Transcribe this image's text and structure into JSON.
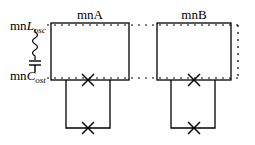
{
  "diagram": {
    "modules": [
      {
        "id": "A",
        "label": "mnA"
      },
      {
        "id": "B",
        "label": "mnB"
      }
    ],
    "components": {
      "inductor": {
        "prefix": "mn",
        "symbol": "L",
        "subscript": "osc"
      },
      "capacitor": {
        "prefix": "mn",
        "symbol": "C",
        "subscript": "ost"
      }
    },
    "junctions": {
      "symbol": "×",
      "count_per_module": 2
    },
    "colors": {
      "stroke": "#000000",
      "background": "#ffffff"
    }
  }
}
